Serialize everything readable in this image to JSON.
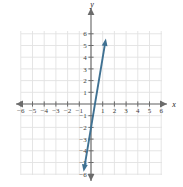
{
  "figure": {
    "title": "",
    "axis_labels": {
      "x": "x",
      "y": "y"
    },
    "origin_label": ""
  },
  "chart_data": {
    "type": "line",
    "title": "",
    "xlabel": "x",
    "ylabel": "y",
    "xlim": [
      -6,
      6
    ],
    "ylim": [
      -6,
      6
    ],
    "grid": true,
    "legend": "none",
    "xticks": [
      -6,
      -5,
      -4,
      -3,
      -2,
      -1,
      1,
      2,
      3,
      4,
      5,
      6
    ],
    "yticks": [
      -6,
      -5,
      -4,
      -3,
      -2,
      -1,
      1,
      2,
      3,
      4,
      5,
      6
    ],
    "xtick_labels": [
      "-6",
      "-5",
      "-4",
      "-3",
      "-2",
      "-1",
      "1",
      "2",
      "3",
      "4",
      "5",
      "6"
    ],
    "ytick_labels": [
      "-6",
      "-5",
      "-4",
      "-3",
      "-2",
      "-1",
      "1",
      "2",
      "3",
      "4",
      "5",
      "6"
    ],
    "series": [
      {
        "name": "line",
        "kind": "straight-line",
        "color": "#3f7192",
        "slope": 6,
        "intercept": -2,
        "equation": "y = 6x - 2",
        "x_intercept": 0.33,
        "y_intercept": -2,
        "arrow_start": true,
        "arrow_end": true,
        "x": [
          -0.63,
          1.27
        ],
        "y": [
          -5.8,
          5.6
        ]
      }
    ]
  },
  "colors": {
    "line": "#3f7192",
    "axis": "#6b6b6b",
    "grid": "#e2e2e2",
    "tick_text": "#3b3b3b",
    "background": "#ffffff"
  },
  "geometry": {
    "origin_px": [
      91,
      104
    ],
    "unit_px": 11.7,
    "grid_left_px": 21,
    "grid_top_px": 31,
    "grid_right_px": 162,
    "grid_bottom_px": 175
  }
}
